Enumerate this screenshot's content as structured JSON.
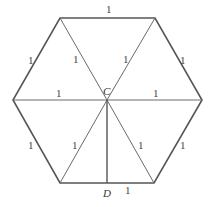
{
  "diagram": {
    "shape": "regular hexagon divided into 6 equilateral triangles",
    "colors": {
      "stroke": "#555555",
      "text": "#444444",
      "background": "#ffffff"
    },
    "points": {
      "center": {
        "label": "C"
      },
      "foot": {
        "label": "D"
      }
    },
    "edge_labels": {
      "top": "1",
      "upper_left": "1",
      "upper_right": "1",
      "lower_left": "1",
      "lower_right": "1",
      "bottom_right_half": "1",
      "spoke_upper_left": "1",
      "spoke_upper_right": "1",
      "spoke_left": "1",
      "spoke_right": "1",
      "spoke_lower_left": "1",
      "spoke_lower_right": "1"
    }
  }
}
